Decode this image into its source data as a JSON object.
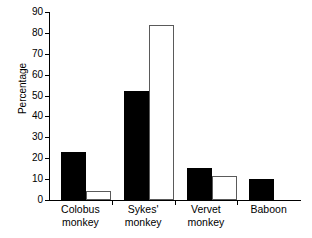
{
  "chart_data": {
    "type": "bar",
    "title": "",
    "xlabel": "",
    "ylabel": "Percentage",
    "ylim": [
      0,
      90
    ],
    "ytick_values": [
      0,
      10,
      20,
      30,
      40,
      50,
      60,
      70,
      80,
      90
    ],
    "ytick_labels": [
      "0",
      "10",
      "20",
      "30",
      "40",
      "50",
      "60",
      "70",
      "80",
      "90"
    ],
    "grid": false,
    "legend": "none",
    "categories": [
      "Colobus monkey",
      "Sykes' monkey",
      "Vervet monkey",
      "Baboon"
    ],
    "category_lines": [
      [
        "Colobus",
        "monkey"
      ],
      [
        "Sykes'",
        "monkey"
      ],
      [
        "Vervet",
        "monkey"
      ],
      [
        "Baboon",
        ""
      ]
    ],
    "series": [
      {
        "name": "filled",
        "style": "solid-black",
        "color": "#000000",
        "values": [
          23,
          52,
          15.5,
          10
        ]
      },
      {
        "name": "open",
        "style": "open-white",
        "color": "#ffffff",
        "values": [
          4.5,
          84,
          11.5,
          null
        ]
      }
    ]
  },
  "axis": {
    "line_color": "#000000",
    "tick_length": 4
  }
}
